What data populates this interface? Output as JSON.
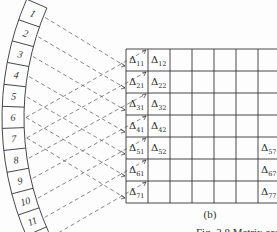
{
  "figure": {
    "subfigure_label": "(b)",
    "caption_partial": "Fig. 2.8   Matrix order (a)",
    "colors": {
      "line": "#333333",
      "dash": "#555555",
      "background": "#fdfdfd"
    }
  },
  "arc_segments": {
    "labels": [
      "1",
      "2",
      "3",
      "4",
      "5",
      "6",
      "7",
      "8",
      "9",
      "10",
      "11",
      "12"
    ],
    "count_visible": 12
  },
  "matrix": {
    "rows": 7,
    "cols_visible": 7,
    "cells": [
      {
        "row": 1,
        "col": 1,
        "label": "Δ",
        "sub": "11"
      },
      {
        "row": 1,
        "col": 2,
        "label": "Δ",
        "sub": "12"
      },
      {
        "row": 2,
        "col": 1,
        "label": "Δ",
        "sub": "21"
      },
      {
        "row": 2,
        "col": 2,
        "label": "Δ",
        "sub": "22"
      },
      {
        "row": 3,
        "col": 1,
        "label": "Δ",
        "sub": "31"
      },
      {
        "row": 3,
        "col": 2,
        "label": "Δ",
        "sub": "32"
      },
      {
        "row": 4,
        "col": 1,
        "label": "Δ",
        "sub": "41"
      },
      {
        "row": 4,
        "col": 2,
        "label": "Δ",
        "sub": "42"
      },
      {
        "row": 5,
        "col": 1,
        "label": "Δ",
        "sub": "51"
      },
      {
        "row": 5,
        "col": 2,
        "label": "Δ",
        "sub": "52"
      },
      {
        "row": 5,
        "col": 7,
        "label": "Δ",
        "sub": "57"
      },
      {
        "row": 6,
        "col": 1,
        "label": "Δ",
        "sub": "61"
      },
      {
        "row": 6,
        "col": 7,
        "label": "Δ",
        "sub": "67"
      },
      {
        "row": 7,
        "col": 1,
        "label": "Δ",
        "sub": "71"
      },
      {
        "row": 7,
        "col": 7,
        "label": "Δ",
        "sub": "77"
      }
    ]
  }
}
